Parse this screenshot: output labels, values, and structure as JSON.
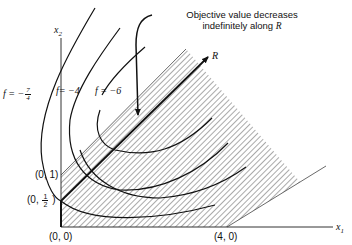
{
  "diagram": {
    "annotation": {
      "line1": "Objective value decreases",
      "line2": "indefinitely along ",
      "ray_name": "R"
    },
    "axes": {
      "x_label": "x",
      "x_sub": "1",
      "y_label": "x",
      "y_sub": "2"
    },
    "ray_label": "R",
    "contours": [
      {
        "prefix": "f = −",
        "frac_num": "7",
        "frac_den": "4"
      },
      {
        "text": "f= −4"
      },
      {
        "text": "f = −6"
      }
    ],
    "points": [
      {
        "label": "(0, 1)"
      },
      {
        "prefix": "(0, ",
        "frac_num": "1",
        "frac_den": "2",
        "suffix": " )"
      },
      {
        "label": "(0, 0)"
      },
      {
        "label": "(4, 0)"
      }
    ],
    "colors": {
      "ink": "#111111",
      "hatch": "#555555",
      "background": "#ffffff"
    }
  }
}
